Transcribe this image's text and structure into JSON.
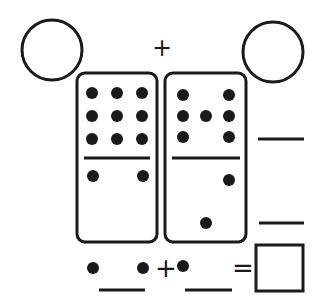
{
  "worksheet": {
    "type": "domino addition",
    "top_plus": "+",
    "bottom_plus": "+",
    "equals": "=",
    "dominoes": [
      {
        "name": "left",
        "top_pips": 9,
        "bottom_pips": 4
      },
      {
        "name": "right",
        "top_pips": 7,
        "bottom_pips": 3
      }
    ],
    "answer_box": "",
    "blank_1": "",
    "blank_2": "",
    "side_blank_top": "",
    "side_blank_bottom": "",
    "circle_left": "",
    "circle_right": ""
  },
  "colors": {
    "ink": "#1a1a1a",
    "paper": "#ffffff"
  }
}
